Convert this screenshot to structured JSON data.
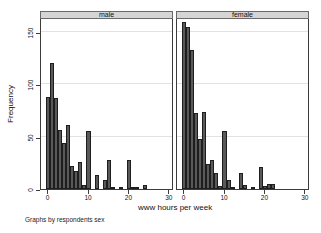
{
  "figure": {
    "ylabel": "Frequency",
    "xlabel": "www hours per week",
    "caption": "Graphs by respondents sex",
    "y_ticks": [
      0,
      50,
      100,
      150
    ],
    "x_ticks": [
      0,
      10,
      20,
      30
    ]
  },
  "chart_data": [
    {
      "type": "bar",
      "title": "male",
      "xlabel": "www hours per week",
      "ylabel": "Frequency",
      "x": [
        0,
        1,
        2,
        3,
        4,
        5,
        6,
        7,
        8,
        9,
        10,
        12,
        14,
        15,
        16,
        18,
        20,
        21,
        22,
        24
      ],
      "values": [
        88,
        120,
        87,
        56,
        44,
        61,
        22,
        17,
        26,
        4,
        55,
        13,
        9,
        28,
        2,
        2,
        28,
        2,
        2,
        4
      ],
      "bin_width": 1,
      "xlim": [
        -1.5,
        31.5
      ],
      "ylim": [
        0,
        163
      ],
      "grid": true,
      "gridlines_y": [
        50,
        100,
        150
      ]
    },
    {
      "type": "bar",
      "title": "female",
      "xlabel": "www hours per week",
      "ylabel": "Frequency",
      "x": [
        0,
        1,
        2,
        3,
        4,
        5,
        6,
        7,
        8,
        9,
        10,
        11,
        12,
        14,
        15,
        17,
        19,
        20,
        21,
        22
      ],
      "values": [
        160,
        155,
        133,
        73,
        48,
        74,
        24,
        28,
        15,
        3,
        55,
        9,
        2,
        15,
        4,
        2,
        21,
        3,
        5,
        5
      ],
      "bin_width": 1,
      "xlim": [
        -1.5,
        31.5
      ],
      "ylim": [
        0,
        163
      ],
      "grid": true,
      "gridlines_y": [
        50,
        100,
        150
      ]
    }
  ],
  "colors": {
    "bar_fill": "#595959",
    "bar_border": "#1e1e1e",
    "strip_background": "#d5d5d5",
    "grid_line": "#e2e2e2",
    "axis": "#3c3c3c",
    "background": "#ffffff"
  }
}
